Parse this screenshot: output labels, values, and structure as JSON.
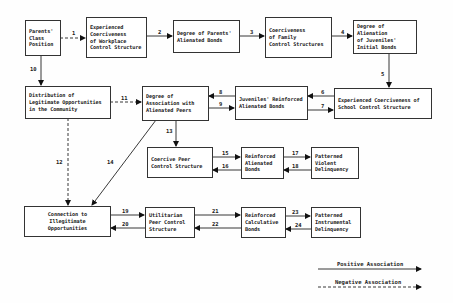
{
  "nodes": {
    "parents_class": "Parents'\nClass\nPosition",
    "workplace": "Experienced\nCoerciveness\nof Workplace\nControl Structure",
    "parents_bonds": "Degree of Parents'\nAlienated Bonds",
    "family": "Coerciveness\nof Family\nControl Structures",
    "juv_initial": "Degree of Alienation\nof Juveniles'\nInitial Bonds",
    "legit_opps": "Distribution of\nLegitimate Opportunities\nin the Community",
    "assoc_peers": "Degree of\nAssociation with\nAlienated Peers",
    "juv_reinforced": "Juveniles' Reinforced\nAlienated Bonds",
    "school": "Experienced Coerciveness of\nSchool Control Structure",
    "coercive_peer": "Coercive Peer\nControl Structure",
    "reinf_alienated": "Reinforced\nAlienated\nBonds",
    "violent": "Patterned\nViolent\nDelinquency",
    "illegit_opps": "Connection to\nIllegitimate\nOpportunities",
    "utilitarian": "Utilitarian\nPeer Control\nStructure",
    "calculative": "Reinforced\nCalculative\nBonds",
    "instrumental": "Patterned\nInstrumental\nDelinquency"
  },
  "edges": {
    "e1": "1",
    "e2": "2",
    "e3": "3",
    "e4": "4",
    "e5": "5",
    "e6": "6",
    "e7": "7",
    "e8": "8",
    "e9": "9",
    "e10": "10",
    "e11": "11",
    "e12": "12",
    "e13": "13",
    "e14": "14",
    "e15": "15",
    "e16": "16",
    "e17": "17",
    "e18": "18",
    "e19": "19",
    "e20": "20",
    "e21": "21",
    "e22": "22",
    "e23": "23",
    "e24": "24"
  },
  "legend": {
    "positive": "Positive Association",
    "negative": "Negative Association"
  }
}
